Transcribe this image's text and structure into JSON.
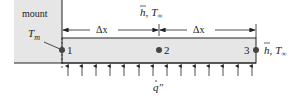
{
  "diagram": {
    "mount_label": "mount",
    "mount_temp": {
      "symbol": "T",
      "subscript": "m"
    },
    "dimension_label": "Δx",
    "convection_label_top": {
      "h": "h",
      "sep": ",",
      "T": "T",
      "sub": "∞"
    },
    "convection_label_right": {
      "h": "h",
      "sep": ",",
      "T": "T",
      "sub": "∞"
    },
    "heat_flux_label": "q″",
    "nodes": [
      {
        "id": "1",
        "label": "1"
      },
      {
        "id": "2",
        "label": "2"
      },
      {
        "id": "3",
        "label": "3"
      }
    ],
    "arrow_count": 14,
    "colors": {
      "fin_fill": "#e6e6e6",
      "mount_fill": "#e6e6e6",
      "line": "#222222",
      "node": "#444444"
    }
  }
}
